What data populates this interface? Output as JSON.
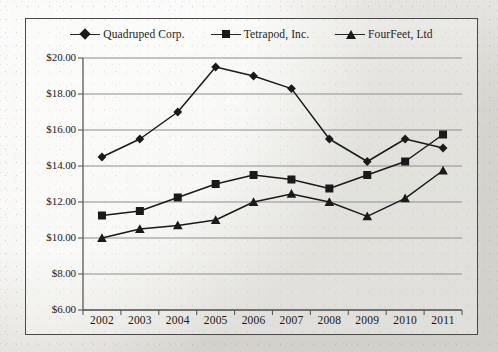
{
  "chart_data": {
    "type": "line",
    "title": "",
    "xlabel": "",
    "ylabel": "",
    "categories": [
      "2002",
      "2003",
      "2004",
      "2005",
      "2006",
      "2007",
      "2008",
      "2009",
      "2010",
      "2011"
    ],
    "ytick_labels": [
      "$20.00",
      "$18.00",
      "$16.00",
      "$14.00",
      "$12.00",
      "$10.00",
      "$8.00",
      "$6.00"
    ],
    "ytick_values": [
      20,
      18,
      16,
      14,
      12,
      10,
      8,
      6
    ],
    "ylim": [
      6,
      20
    ],
    "grid": true,
    "legend_position": "top",
    "series": [
      {
        "name": "Quadruped Corp.",
        "marker": "diamond",
        "color": "#1a1a1a",
        "values": [
          14.5,
          15.5,
          17.0,
          19.5,
          19.0,
          18.3,
          15.5,
          14.25,
          15.5,
          15.0
        ]
      },
      {
        "name": "Tetrapod, Inc.",
        "marker": "square",
        "color": "#1a1a1a",
        "values": [
          11.25,
          11.5,
          12.25,
          13.0,
          13.5,
          13.25,
          12.75,
          13.5,
          14.25,
          15.75
        ]
      },
      {
        "name": "FourFeet, Ltd",
        "marker": "triangle",
        "color": "#1a1a1a",
        "values": [
          10.0,
          10.5,
          10.7,
          11.0,
          12.0,
          12.45,
          12.0,
          11.2,
          12.2,
          13.75
        ]
      }
    ]
  },
  "colors": {
    "ink": "#1a1a1a",
    "frame": "#4a4a4a",
    "gridline": "#8d8d8d",
    "axis": "#5a5a5a",
    "paper": "#e9e8e4"
  }
}
